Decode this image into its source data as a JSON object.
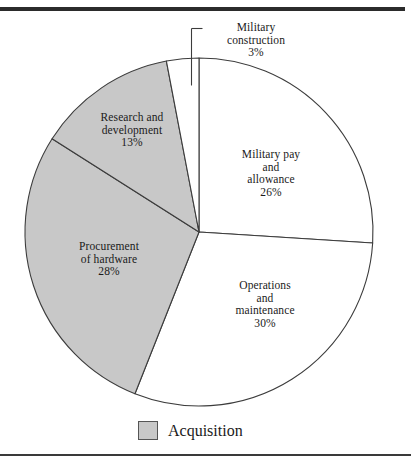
{
  "figure": {
    "name": "defense-budget-pie-chart",
    "background": "#ffffff",
    "rule_color": "#2b2b2b"
  },
  "legend": {
    "position": "bottom-center",
    "swatch_color": "#c8c8c8",
    "label": "Acquisition"
  },
  "labels": {
    "military_construction": "Military\nconstruction\n3%",
    "military_pay": "Military pay\nand\nallowance\n26%",
    "operations": "Operations\nand\nmaintenance\n30%",
    "procurement": "Procurement\nof hardware\n28%",
    "research_development": "Research and\ndevelopment\n13%"
  },
  "chart_data": {
    "type": "pie",
    "title": "",
    "subtitle": "",
    "xlabel": "",
    "ylabel": "",
    "grid": false,
    "legend_position": "bottom-center",
    "legend_entries": [
      "Acquisition"
    ],
    "start_angle_deg": 0,
    "direction": "clockwise",
    "center_px": [
      199,
      232
    ],
    "radius_px": 174,
    "categories": [
      "Military pay and allowance",
      "Operations and maintenance",
      "Procurement of hardware",
      "Research and development",
      "Military construction"
    ],
    "values": [
      26,
      30,
      28,
      13,
      3
    ],
    "unit": "percent",
    "slices": [
      {
        "name": "Military pay and allowance",
        "label_lines": [
          "Military pay",
          "and",
          "allowance",
          "26%"
        ],
        "value": 26,
        "value_text": "26%",
        "color": "#ffffff",
        "edge_color": "#3c3c3c",
        "start_deg": 0,
        "end_deg": 93.6,
        "acquisition": false
      },
      {
        "name": "Operations and maintenance",
        "label_lines": [
          "Operations",
          "and",
          "maintenance",
          "30%"
        ],
        "value": 30,
        "value_text": "30%",
        "color": "#ffffff",
        "edge_color": "#3c3c3c",
        "start_deg": 93.6,
        "end_deg": 201.6,
        "acquisition": false
      },
      {
        "name": "Procurement of hardware",
        "label_lines": [
          "Procurement",
          "of hardware",
          "28%"
        ],
        "value": 28,
        "value_text": "28%",
        "color": "#c8c8c8",
        "edge_color": "#3c3c3c",
        "start_deg": 201.6,
        "end_deg": 302.4,
        "acquisition": true
      },
      {
        "name": "Research and development",
        "label_lines": [
          "Research and",
          "development",
          "13%"
        ],
        "value": 13,
        "value_text": "13%",
        "color": "#c8c8c8",
        "edge_color": "#3c3c3c",
        "start_deg": 302.4,
        "end_deg": 349.2,
        "acquisition": true
      },
      {
        "name": "Military construction",
        "label_lines": [
          "Military",
          "construction",
          "3%"
        ],
        "value": 3,
        "value_text": "3%",
        "color": "#ffffff",
        "edge_color": "#3c3c3c",
        "start_deg": 349.2,
        "end_deg": 360,
        "acquisition": false,
        "has_leader_line": true
      }
    ]
  }
}
